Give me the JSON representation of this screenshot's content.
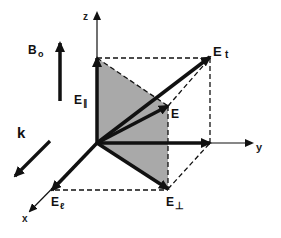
{
  "figure": {
    "colors": {
      "ink": "#111111",
      "plane_fill": "#a9a9a9",
      "background": "#ffffff"
    },
    "axes": {
      "x": {
        "label": "x"
      },
      "y": {
        "label": "y"
      },
      "z": {
        "label": "z"
      }
    },
    "vectors": {
      "E_total": {
        "label": "E",
        "sub": "t"
      },
      "E": {
        "label": "E",
        "sub": ""
      },
      "E_parallel": {
        "label": "E",
        "sub": "∥"
      },
      "E_perp": {
        "label": "E",
        "sub": "⊥"
      },
      "E_longitudinal": {
        "label": "E",
        "sub": "ℓ"
      }
    },
    "reference_arrows": {
      "B0": {
        "label": "B",
        "sub": "o"
      },
      "k": {
        "label": "k"
      }
    }
  }
}
